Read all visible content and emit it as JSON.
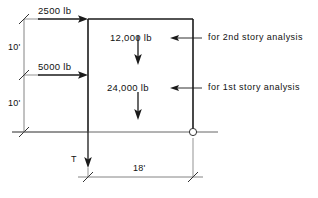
{
  "diagram": {
    "type": "structural-free-body-diagram",
    "units": {
      "force": "lb",
      "length": "ft"
    },
    "lateral_loads": [
      {
        "id": "lateral-top",
        "label": "2500 lb",
        "value": 2500,
        "direction": "right",
        "applied_at": "top-of-column"
      },
      {
        "id": "lateral-middle",
        "label": "5000 lb",
        "value": 5000,
        "direction": "right",
        "applied_at": "mid-height-of-column"
      }
    ],
    "vertical_loads": [
      {
        "id": "vertical-second-story",
        "label": "12,000 lb",
        "value": 12000,
        "direction": "down",
        "note": "for 2nd story analysis"
      },
      {
        "id": "vertical-first-story",
        "label": "24,000 lb",
        "value": 24000,
        "direction": "down",
        "note": "for 1st story analysis"
      }
    ],
    "notes": [
      {
        "id": "note-second-story",
        "label": "for 2nd story analysis"
      },
      {
        "id": "note-first-story",
        "label": "for 1st story analysis"
      }
    ],
    "dimensions": [
      {
        "id": "story-height-upper",
        "label": "10'",
        "value": 10,
        "orientation": "vertical"
      },
      {
        "id": "story-height-lower",
        "label": "10'",
        "value": 10,
        "orientation": "vertical"
      },
      {
        "id": "bay-width",
        "label": "18'",
        "value": 18,
        "orientation": "horizontal"
      }
    ],
    "reactions": [
      {
        "id": "tension-force",
        "label": "T",
        "direction": "down",
        "location": "base-of-left-column"
      }
    ],
    "supports": [
      {
        "id": "pin-support",
        "symbol": "circle",
        "location": "base-of-right-column"
      }
    ],
    "colors": {
      "background": "#ffffff",
      "line": "#1a1a1a",
      "dimension_line": "#555555",
      "text": "#111111"
    }
  }
}
